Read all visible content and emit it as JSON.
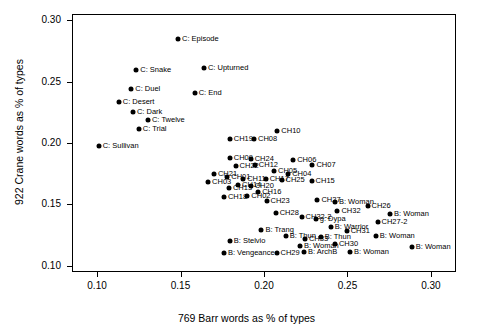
{
  "chart_data": {
    "type": "scatter",
    "title": "",
    "xlabel": "769 Barr words as % of types",
    "ylabel": "922 Crane words as % of types",
    "xlim": [
      0.085,
      0.315
    ],
    "ylim": [
      0.095,
      0.305
    ],
    "xticks": [
      "0.10",
      "0.15",
      "0.20",
      "0.25",
      "0.30"
    ],
    "xtickvalues": [
      0.1,
      0.15,
      0.2,
      0.25,
      0.3
    ],
    "yticks": [
      "0.10",
      "0.15",
      "0.20",
      "0.25",
      "0.30"
    ],
    "ytickvalues": [
      0.1,
      0.15,
      0.2,
      0.25,
      0.3
    ],
    "grid": false,
    "legend": "none",
    "points": [
      {
        "label": "C: Episode",
        "x": 0.1485,
        "y": 0.2845,
        "lp": "right"
      },
      {
        "label": "C: Upturned",
        "x": 0.164,
        "y": 0.261,
        "lp": "right"
      },
      {
        "label": "C: Snake",
        "x": 0.1235,
        "y": 0.2595,
        "lp": "right"
      },
      {
        "label": "C: Duel",
        "x": 0.1205,
        "y": 0.244,
        "lp": "right"
      },
      {
        "label": "C: End",
        "x": 0.1585,
        "y": 0.2405,
        "lp": "right"
      },
      {
        "label": "C: Desert",
        "x": 0.113,
        "y": 0.233,
        "lp": "right"
      },
      {
        "label": "C: Dark",
        "x": 0.1215,
        "y": 0.225,
        "lp": "right"
      },
      {
        "label": "C: Twelve",
        "x": 0.1305,
        "y": 0.2185,
        "lp": "right"
      },
      {
        "label": "C: Trial",
        "x": 0.125,
        "y": 0.211,
        "lp": "right"
      },
      {
        "label": "C: Sullivan",
        "x": 0.101,
        "y": 0.1975,
        "lp": "right"
      },
      {
        "label": "CH10",
        "x": 0.208,
        "y": 0.21,
        "lp": "right"
      },
      {
        "label": "CH19",
        "x": 0.1795,
        "y": 0.2035,
        "lp": "right"
      },
      {
        "label": "CH08",
        "x": 0.194,
        "y": 0.203,
        "lp": "right"
      },
      {
        "label": "CH24",
        "x": 0.192,
        "y": 0.187,
        "lp": "right"
      },
      {
        "label": "CH09",
        "x": 0.1795,
        "y": 0.1875,
        "lp": "right"
      },
      {
        "label": "CH22",
        "x": 0.183,
        "y": 0.1815,
        "lp": "right"
      },
      {
        "label": "CH12",
        "x": 0.1945,
        "y": 0.182,
        "lp": "right"
      },
      {
        "label": "CH06",
        "x": 0.2175,
        "y": 0.186,
        "lp": "right"
      },
      {
        "label": "CH07",
        "x": 0.229,
        "y": 0.1825,
        "lp": "right"
      },
      {
        "label": "CH05",
        "x": 0.206,
        "y": 0.1775,
        "lp": "right"
      },
      {
        "label": "CH04",
        "x": 0.2145,
        "y": 0.1745,
        "lp": "right"
      },
      {
        "label": "CH21",
        "x": 0.17,
        "y": 0.175,
        "lp": "right"
      },
      {
        "label": "CH01",
        "x": 0.178,
        "y": 0.1725,
        "lp": "right"
      },
      {
        "label": "CH11",
        "x": 0.1875,
        "y": 0.171,
        "lp": "right"
      },
      {
        "label": "CH17",
        "x": 0.201,
        "y": 0.171,
        "lp": "right"
      },
      {
        "label": "CH25",
        "x": 0.2105,
        "y": 0.17,
        "lp": "right"
      },
      {
        "label": "CH15",
        "x": 0.2285,
        "y": 0.169,
        "lp": "right"
      },
      {
        "label": "CH03",
        "x": 0.1665,
        "y": 0.168,
        "lp": "right"
      },
      {
        "label": "CH14",
        "x": 0.1845,
        "y": 0.166,
        "lp": "right"
      },
      {
        "label": "CH20",
        "x": 0.192,
        "y": 0.165,
        "lp": "right"
      },
      {
        "label": "CH13",
        "x": 0.179,
        "y": 0.163,
        "lp": "right"
      },
      {
        "label": "CH16",
        "x": 0.1965,
        "y": 0.1605,
        "lp": "right"
      },
      {
        "label": "CH18",
        "x": 0.176,
        "y": 0.156,
        "lp": "right"
      },
      {
        "label": "CH02",
        "x": 0.19,
        "y": 0.1565,
        "lp": "right"
      },
      {
        "label": "CH23",
        "x": 0.2015,
        "y": 0.1525,
        "lp": "right"
      },
      {
        "label": "CH27",
        "x": 0.232,
        "y": 0.154,
        "lp": "right"
      },
      {
        "label": "B: Woman",
        "x": 0.2425,
        "y": 0.152,
        "lp": "right"
      },
      {
        "label": "CH26",
        "x": 0.262,
        "y": 0.149,
        "lp": "right"
      },
      {
        "label": "CH28",
        "x": 0.207,
        "y": 0.143,
        "lp": "right"
      },
      {
        "label": "CH32",
        "x": 0.244,
        "y": 0.1445,
        "lp": "right"
      },
      {
        "label": "CH32-2",
        "x": 0.2225,
        "y": 0.1395,
        "lp": "right"
      },
      {
        "label": "g: Dypa",
        "x": 0.231,
        "y": 0.138,
        "lp": "right"
      },
      {
        "label": "B: Woman",
        "x": 0.2755,
        "y": 0.142,
        "lp": "right"
      },
      {
        "label": "CH27-2",
        "x": 0.268,
        "y": 0.1355,
        "lp": "right"
      },
      {
        "label": "B: Warrior",
        "x": 0.24,
        "y": 0.132,
        "lp": "right"
      },
      {
        "label": "B: Trang",
        "x": 0.1985,
        "y": 0.1295,
        "lp": "right"
      },
      {
        "label": "CH31",
        "x": 0.2495,
        "y": 0.128,
        "lp": "right"
      },
      {
        "label": "B: Thun",
        "x": 0.213,
        "y": 0.124,
        "lp": "right"
      },
      {
        "label": "CH33",
        "x": 0.2245,
        "y": 0.1215,
        "lp": "right"
      },
      {
        "label": "B: Thun",
        "x": 0.234,
        "y": 0.1235,
        "lp": "right"
      },
      {
        "label": "B: Woman",
        "x": 0.267,
        "y": 0.1245,
        "lp": "right"
      },
      {
        "label": "B: Stelvio",
        "x": 0.1795,
        "y": 0.1205,
        "lp": "right"
      },
      {
        "label": "B: Woman",
        "x": 0.2215,
        "y": 0.116,
        "lp": "right"
      },
      {
        "label": "CH30",
        "x": 0.2425,
        "y": 0.1175,
        "lp": "right"
      },
      {
        "label": "B: Woman",
        "x": 0.2885,
        "y": 0.1155,
        "lp": "right"
      },
      {
        "label": "B: Vengeance",
        "x": 0.176,
        "y": 0.1105,
        "lp": "right"
      },
      {
        "label": "CH29",
        "x": 0.2075,
        "y": 0.1105,
        "lp": "right"
      },
      {
        "label": "B: ArchB",
        "x": 0.224,
        "y": 0.111,
        "lp": "right"
      },
      {
        "label": "B: Woman",
        "x": 0.2515,
        "y": 0.1115,
        "lp": "right"
      }
    ]
  }
}
